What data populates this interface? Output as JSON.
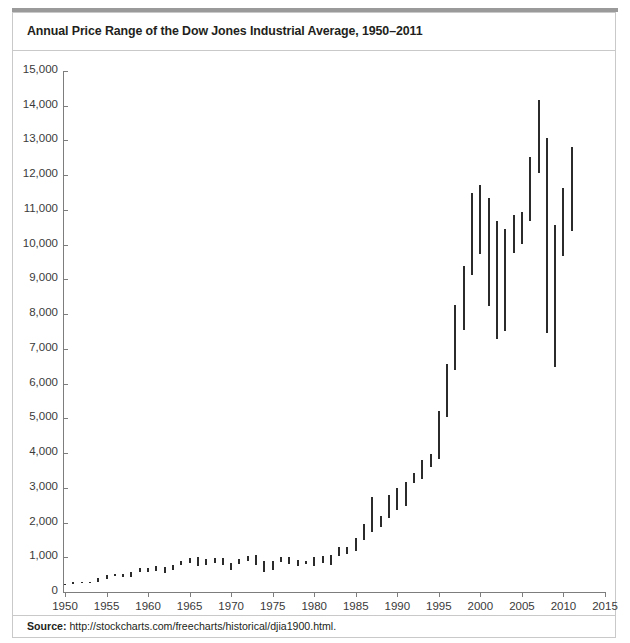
{
  "figure": {
    "title": "Annual Price Range of the Dow Jones Industrial Average, 1950–2011",
    "source_label": "Source:",
    "source_url": "http://stockcharts.com/freecharts/historical/djia1900.html."
  },
  "chart_data": {
    "type": "bar",
    "subtype": "high-low-range",
    "title": "Annual Price Range of the Dow Jones Industrial Average, 1950–2011",
    "xlabel": "Year",
    "ylabel": "",
    "xlim": [
      1950,
      2015
    ],
    "ylim": [
      0,
      15000
    ],
    "grid": false,
    "legend": null,
    "x_ticks": [
      1950,
      1955,
      1960,
      1965,
      1970,
      1975,
      1980,
      1985,
      1990,
      1995,
      2000,
      2005,
      2010,
      2015
    ],
    "y_ticks": [
      0,
      1000,
      2000,
      3000,
      4000,
      5000,
      6000,
      7000,
      8000,
      9000,
      10000,
      11000,
      12000,
      13000,
      14000,
      15000
    ],
    "y_tick_labels": [
      "0",
      "1,000",
      "2,000",
      "3,000",
      "4,000",
      "5,000",
      "6,000",
      "7,000",
      "8,000",
      "9,000",
      "10,000",
      "11,000",
      "12,000",
      "13,000",
      "14,000",
      "15,000"
    ],
    "x_tick_labels": [
      "1950",
      "1955",
      "1960",
      "1965",
      "1970",
      "1975",
      "1980",
      "1985",
      "1990",
      "1995",
      "2000",
      "2005",
      "2010",
      "2015"
    ],
    "series_name": "Annual high-low range",
    "bar_color": "#2b2b2b",
    "points": [
      {
        "year": 1950,
        "low": 196,
        "high": 235
      },
      {
        "year": 1951,
        "low": 238,
        "high": 276
      },
      {
        "year": 1952,
        "low": 256,
        "high": 292
      },
      {
        "year": 1953,
        "low": 255,
        "high": 293
      },
      {
        "year": 1954,
        "low": 279,
        "high": 404
      },
      {
        "year": 1955,
        "low": 388,
        "high": 488
      },
      {
        "year": 1956,
        "low": 462,
        "high": 521
      },
      {
        "year": 1957,
        "low": 419,
        "high": 521
      },
      {
        "year": 1958,
        "low": 436,
        "high": 584
      },
      {
        "year": 1959,
        "low": 574,
        "high": 679
      },
      {
        "year": 1960,
        "low": 566,
        "high": 688
      },
      {
        "year": 1961,
        "low": 610,
        "high": 735
      },
      {
        "year": 1962,
        "low": 535,
        "high": 726
      },
      {
        "year": 1963,
        "low": 646,
        "high": 767
      },
      {
        "year": 1964,
        "low": 766,
        "high": 891
      },
      {
        "year": 1965,
        "low": 840,
        "high": 969
      },
      {
        "year": 1966,
        "low": 744,
        "high": 995
      },
      {
        "year": 1967,
        "low": 786,
        "high": 943
      },
      {
        "year": 1968,
        "low": 825,
        "high": 985
      },
      {
        "year": 1969,
        "low": 769,
        "high": 968
      },
      {
        "year": 1970,
        "low": 631,
        "high": 842
      },
      {
        "year": 1971,
        "low": 797,
        "high": 951
      },
      {
        "year": 1972,
        "low": 889,
        "high": 1036
      },
      {
        "year": 1973,
        "low": 788,
        "high": 1051
      },
      {
        "year": 1974,
        "low": 577,
        "high": 891
      },
      {
        "year": 1975,
        "low": 632,
        "high": 881
      },
      {
        "year": 1976,
        "low": 858,
        "high": 1014
      },
      {
        "year": 1977,
        "low": 800,
        "high": 999
      },
      {
        "year": 1978,
        "low": 742,
        "high": 907
      },
      {
        "year": 1979,
        "low": 796,
        "high": 897
      },
      {
        "year": 1980,
        "low": 759,
        "high": 1000
      },
      {
        "year": 1981,
        "low": 824,
        "high": 1024
      },
      {
        "year": 1982,
        "low": 776,
        "high": 1070
      },
      {
        "year": 1983,
        "low": 1027,
        "high": 1287
      },
      {
        "year": 1984,
        "low": 1086,
        "high": 1286
      },
      {
        "year": 1985,
        "low": 1184,
        "high": 1553
      },
      {
        "year": 1986,
        "low": 1502,
        "high": 1955
      },
      {
        "year": 1987,
        "low": 1738,
        "high": 2722
      },
      {
        "year": 1988,
        "low": 1879,
        "high": 2183
      },
      {
        "year": 1989,
        "low": 2144,
        "high": 2791
      },
      {
        "year": 1990,
        "low": 2365,
        "high": 3000
      },
      {
        "year": 1991,
        "low": 2470,
        "high": 3169
      },
      {
        "year": 1992,
        "low": 3136,
        "high": 3413
      },
      {
        "year": 1993,
        "low": 3242,
        "high": 3794
      },
      {
        "year": 1994,
        "low": 3593,
        "high": 3978
      },
      {
        "year": 1995,
        "low": 3832,
        "high": 5216
      },
      {
        "year": 1996,
        "low": 5032,
        "high": 6560
      },
      {
        "year": 1997,
        "low": 6392,
        "high": 8259
      },
      {
        "year": 1998,
        "low": 7539,
        "high": 9374
      },
      {
        "year": 1999,
        "low": 9120,
        "high": 11497
      },
      {
        "year": 2000,
        "low": 9731,
        "high": 11723
      },
      {
        "year": 2001,
        "low": 8236,
        "high": 11338
      },
      {
        "year": 2002,
        "low": 7286,
        "high": 10673
      },
      {
        "year": 2003,
        "low": 7525,
        "high": 10453
      },
      {
        "year": 2004,
        "low": 9749,
        "high": 10855
      },
      {
        "year": 2005,
        "low": 10012,
        "high": 10941
      },
      {
        "year": 2006,
        "low": 10667,
        "high": 12510
      },
      {
        "year": 2007,
        "low": 12050,
        "high": 14164
      },
      {
        "year": 2008,
        "low": 7449,
        "high": 13058
      },
      {
        "year": 2009,
        "low": 6470,
        "high": 10580
      },
      {
        "year": 2010,
        "low": 9686,
        "high": 11625
      },
      {
        "year": 2011,
        "low": 10404,
        "high": 12810
      }
    ]
  }
}
